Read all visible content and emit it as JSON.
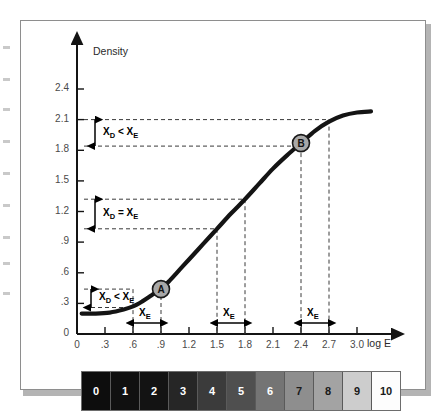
{
  "chart_data": {
    "type": "line",
    "title": "",
    "xlabel": "log E",
    "ylabel": "Density",
    "xlim": [
      0,
      3.25
    ],
    "ylim": [
      0,
      2.55
    ],
    "grid": false,
    "legend": "none",
    "x_ticks": [
      "0",
      ".3",
      ".6",
      ".9",
      "1.2",
      "1.5",
      "1.8",
      "2.1",
      "2.4",
      "2.7",
      "3.0"
    ],
    "x_tick_values": [
      0,
      0.3,
      0.6,
      0.9,
      1.2,
      1.5,
      1.8,
      2.1,
      2.4,
      2.7,
      3.0
    ],
    "y_ticks": [
      "0",
      ".3",
      ".6",
      ".9",
      "1.2",
      "1.5",
      "1.8",
      "2.1",
      "2.4"
    ],
    "y_tick_values": [
      0,
      0.3,
      0.6,
      0.9,
      1.2,
      1.5,
      1.8,
      2.1,
      2.4
    ],
    "series": [
      {
        "name": "characteristic curve",
        "x": [
          0.05,
          0.2,
          0.35,
          0.5,
          0.6,
          0.7,
          0.8,
          0.9,
          1.0,
          1.1,
          1.2,
          1.35,
          1.5,
          1.65,
          1.8,
          1.95,
          2.1,
          2.25,
          2.4,
          2.55,
          2.7,
          2.85,
          3.0,
          3.15
        ],
        "y": [
          0.2,
          0.2,
          0.21,
          0.24,
          0.27,
          0.32,
          0.38,
          0.44,
          0.53,
          0.63,
          0.73,
          0.88,
          1.03,
          1.18,
          1.32,
          1.47,
          1.62,
          1.75,
          1.87,
          1.99,
          2.08,
          2.14,
          2.17,
          2.18
        ]
      }
    ],
    "points": [
      {
        "label": "A",
        "x": 0.9,
        "y": 0.44
      },
      {
        "label": "B",
        "x": 2.4,
        "y": 1.87
      }
    ],
    "annotations": [
      {
        "id": "top",
        "text": "X_D < X_E",
        "y_from": 2.1,
        "y_to": 1.84
      },
      {
        "id": "middle",
        "text": "X_D = X_E",
        "y_from": 1.32,
        "y_to": 1.03
      },
      {
        "id": "bottom",
        "text": "X_D < X_E",
        "y_from": 0.44,
        "y_to": 0.26
      }
    ],
    "exposure_spans": [
      {
        "label": "X_E",
        "x_from": 0.6,
        "x_to": 0.9
      },
      {
        "label": "X_E",
        "x_from": 1.5,
        "x_to": 1.8
      },
      {
        "label": "X_E",
        "x_from": 2.4,
        "x_to": 2.7
      }
    ]
  },
  "axes": {
    "y_title": "Density",
    "x_title": "log E"
  },
  "annotation_labels": {
    "top_prefix": "X",
    "top_sub": "D",
    "top_relation": "<",
    "top_suffix": "X",
    "top_suffix_sub": "E",
    "mid_relation": "=",
    "xe_main": "X",
    "xe_sub": "E"
  },
  "annotations_text": {
    "top": {
      "left_var": "X",
      "left_sub": "D",
      "op": "<",
      "right_var": "X",
      "right_sub": "E"
    },
    "middle": {
      "left_var": "X",
      "left_sub": "D",
      "op": "=",
      "right_var": "X",
      "right_sub": "E"
    },
    "bottom": {
      "left_var": "X",
      "left_sub": "D",
      "op": "<",
      "right_var": "X",
      "right_sub": "E"
    }
  },
  "step_wedge": {
    "patches": [
      {
        "label": "0",
        "color": "#0d0d0d",
        "text_color": "#ffffff"
      },
      {
        "label": "1",
        "color": "#101010",
        "text_color": "#ffffff"
      },
      {
        "label": "2",
        "color": "#131313",
        "text_color": "#ffffff"
      },
      {
        "label": "3",
        "color": "#262626",
        "text_color": "#ffffff"
      },
      {
        "label": "4",
        "color": "#3b3b3b",
        "text_color": "#ffffff"
      },
      {
        "label": "5",
        "color": "#4f4f4f",
        "text_color": "#ffffff"
      },
      {
        "label": "6",
        "color": "#747474",
        "text_color": "#ffffff"
      },
      {
        "label": "7",
        "color": "#8e8e8e",
        "text_color": "#1a1a1a"
      },
      {
        "label": "8",
        "color": "#a3a3a3",
        "text_color": "#1a1a1a"
      },
      {
        "label": "9",
        "color": "#cdcdcd",
        "text_color": "#1a1a1a"
      },
      {
        "label": "10",
        "color": "#fdfdfd",
        "text_color": "#1a1a1a"
      }
    ]
  },
  "colors": {
    "curve": "#141414",
    "axis": "#141414",
    "dashed": "#3a3a3a",
    "panel_border": "#8e8e8e",
    "marker_fill": "#a8a8a8",
    "marker_stroke": "#1a1a1a"
  }
}
